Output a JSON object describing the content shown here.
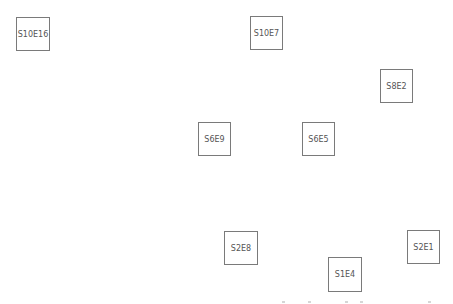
{
  "diagram": {
    "nodes": [
      {
        "id": "S10E16",
        "label": "S10E16",
        "x": 16,
        "y": 17,
        "w": 34,
        "h": 34
      },
      {
        "id": "S10E7",
        "label": "S10E7",
        "x": 250,
        "y": 16,
        "w": 33,
        "h": 34
      },
      {
        "id": "S8E2",
        "label": "S8E2",
        "x": 380,
        "y": 69,
        "w": 33,
        "h": 34
      },
      {
        "id": "S6E9",
        "label": "S6E9",
        "x": 198,
        "y": 122,
        "w": 33,
        "h": 34
      },
      {
        "id": "S6E5",
        "label": "S6E5",
        "x": 302,
        "y": 122,
        "w": 33,
        "h": 34
      },
      {
        "id": "S2E8",
        "label": "S2E8",
        "x": 224,
        "y": 231,
        "w": 34,
        "h": 34
      },
      {
        "id": "S2E1",
        "label": "S2E1",
        "x": 407,
        "y": 230,
        "w": 33,
        "h": 34
      },
      {
        "id": "S1E4",
        "label": "S1E4",
        "x": 328,
        "y": 257,
        "w": 34,
        "h": 35
      }
    ],
    "colors": {
      "border": "#7a7a7a",
      "text": "#555555",
      "background": "#ffffff"
    }
  }
}
